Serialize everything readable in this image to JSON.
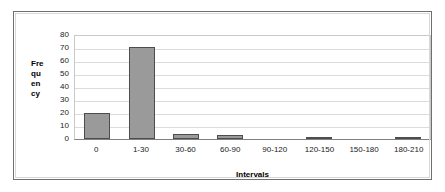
{
  "chart_data": {
    "type": "bar",
    "title": "",
    "xlabel": "Intervals",
    "ylabel": "Frequency",
    "ylabel_stacked": [
      "Fre",
      "qu",
      "en",
      "cy"
    ],
    "categories": [
      "0",
      "1-30",
      "30-60",
      "60-90",
      "90-120",
      "120-150",
      "150-180",
      "180-210"
    ],
    "values": [
      20,
      70,
      4,
      3,
      0,
      1,
      0,
      1
    ],
    "yticks": [
      "80",
      "70",
      "60",
      "50",
      "40",
      "30",
      "20",
      "10",
      "0"
    ],
    "ylim": [
      0,
      80
    ],
    "ystep": 10,
    "grid": true,
    "legend": "none",
    "bar_color": "#9a9a9a",
    "bar_border_color": "#4d4d4d",
    "gridline_color": "#dcdcdc",
    "axis_color": "#808080",
    "frame_color": "#6f6f6f"
  }
}
